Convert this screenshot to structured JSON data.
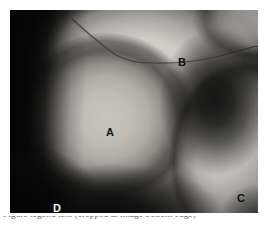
{
  "figure": {
    "kind": "grayscale-anatomical-photograph",
    "frame": {
      "x": 10,
      "y": 10,
      "width": 248,
      "height": 203,
      "border_color": "#0b0b0b",
      "background_color": "#ffffff"
    },
    "labels": [
      {
        "id": "A",
        "text": "A",
        "x": 96,
        "y": 117,
        "tone": "dark",
        "region": "large-rounded-mass-center-left"
      },
      {
        "id": "B",
        "text": "B",
        "x": 168,
        "y": 47,
        "tone": "dark",
        "region": "upper-pale-sheet-right-of-crease"
      },
      {
        "id": "C",
        "text": "C",
        "x": 227,
        "y": 183,
        "tone": "dark",
        "region": "bright-limb-lower-right"
      },
      {
        "id": "D",
        "text": "D",
        "x": 43,
        "y": 193,
        "tone": "light",
        "region": "dark-field-lower-left"
      }
    ],
    "crease": {
      "name": "skin-fold-crease-line",
      "color": "#3a3833",
      "path": "M 62 9 C 72 18, 86 30, 100 41 C 112 50, 126 53, 142 53 C 168 54, 196 50, 214 45 C 228 41, 238 38, 248 36"
    },
    "caption": {
      "visible_fragment": "clipped — only the ascender tops of the caption line are rendered at the bottom edge",
      "text": "Figure legend text (cropped at image bottom edge)"
    }
  }
}
